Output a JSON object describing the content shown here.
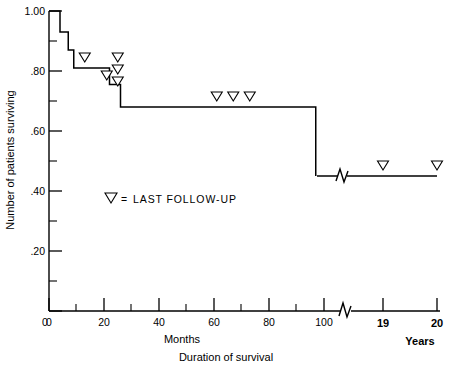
{
  "chart_data": {
    "type": "line",
    "subtype": "kaplan-meier-step",
    "title": "",
    "xlabel": "Duration of survival",
    "xlabel_primary": "Months",
    "xlabel_secondary": "Years",
    "ylabel": "Number of patients surviving",
    "xlim": [
      0,
      110
    ],
    "ylim": [
      0,
      1.0
    ],
    "grid": false,
    "legend_position": "inside-left",
    "y_ticks_major": [
      "1.00",
      ".80",
      ".60",
      ".40",
      ".20",
      "0"
    ],
    "y_tick_values": [
      1.0,
      0.8,
      0.6,
      0.4,
      0.2,
      0.0
    ],
    "y_ticks_minor": [
      0.9,
      0.7,
      0.5,
      0.3,
      0.1
    ],
    "x_ticks_major": [
      "0",
      "20",
      "40",
      "60",
      "80",
      "100"
    ],
    "x_tick_values": [
      0,
      20,
      40,
      60,
      80,
      100
    ],
    "x_ticks_minor": [
      10,
      30,
      50,
      70,
      90
    ],
    "x_ticks_years": [
      "19",
      "20"
    ],
    "x_tick_year_values": [
      19,
      20
    ],
    "axis_break_after_months": 104,
    "curve_break_after_months": 104,
    "series": [
      {
        "name": "Survival",
        "step_points": [
          {
            "x": 0,
            "y": 1.0
          },
          {
            "x": 4,
            "y": 1.0
          },
          {
            "x": 4,
            "y": 0.93
          },
          {
            "x": 7,
            "y": 0.93
          },
          {
            "x": 7,
            "y": 0.87
          },
          {
            "x": 9,
            "y": 0.87
          },
          {
            "x": 9,
            "y": 0.81
          },
          {
            "x": 22,
            "y": 0.81
          },
          {
            "x": 22,
            "y": 0.755
          },
          {
            "x": 26,
            "y": 0.755
          },
          {
            "x": 26,
            "y": 0.68
          },
          {
            "x": 97,
            "y": 0.68
          },
          {
            "x": 97,
            "y": 0.45
          }
        ],
        "tail_segment": {
          "from_years": 18.2,
          "to_years": 20.0,
          "y": 0.45
        }
      }
    ],
    "censored_marker": "down-triangle-open",
    "censored_points_months": [
      {
        "x": 13,
        "y": 0.845
      },
      {
        "x": 21,
        "y": 0.785
      },
      {
        "x": 25,
        "y": 0.845
      },
      {
        "x": 25,
        "y": 0.805
      },
      {
        "x": 25,
        "y": 0.765
      },
      {
        "x": 61,
        "y": 0.715
      },
      {
        "x": 67,
        "y": 0.715
      },
      {
        "x": 73,
        "y": 0.715
      }
    ],
    "censored_points_years": [
      {
        "x": 19,
        "y": 0.485
      },
      {
        "x": 20,
        "y": 0.485
      }
    ]
  },
  "legend": {
    "symbol": "down-triangle-open",
    "equals": "=",
    "text": "LAST FOLLOW-UP"
  },
  "colors": {
    "background": "#ffffff",
    "ink": "#000000",
    "marker_fill": "#ffffff"
  }
}
